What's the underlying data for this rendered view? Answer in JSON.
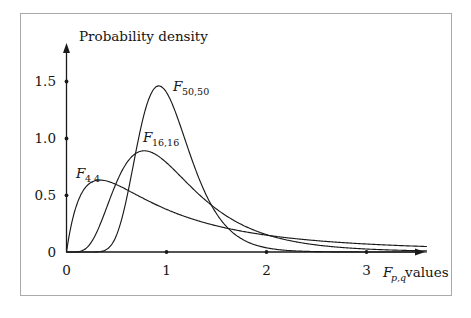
{
  "figure": {
    "background_color": "#ffffff",
    "frame_color": "#a9a9a9",
    "ink_color": "#1a1a1a"
  },
  "chart_data": {
    "type": "line",
    "title": "",
    "subtitle": "",
    "xlabel": "F_{p,q} values",
    "xlabel_base": "F",
    "xlabel_subscript": "p,q",
    "xlabel_suffix": "values",
    "ylabel": "Probability density",
    "xlim": [
      0,
      3.6
    ],
    "ylim": [
      0,
      1.62
    ],
    "grid": false,
    "legend_position": "inline-annotations",
    "xticks": [
      0,
      1,
      2,
      3
    ],
    "xtick_labels": [
      "0",
      "1",
      "2",
      "3"
    ],
    "yticks": [
      0,
      0.5,
      1.0,
      1.5
    ],
    "ytick_labels": [
      "0",
      "0.5",
      "1.0",
      "1.5"
    ],
    "tick_style": "dot",
    "axis_arrows": true,
    "series": [
      {
        "name": "F_{4,4}",
        "label_base": "F",
        "label_subscript": "4,4",
        "distribution": "F",
        "df1": 4,
        "df2": 4,
        "mode_x": 0.4,
        "peak_y": 0.62,
        "label_x": 0.13,
        "label_y": 0.79,
        "x": [
          0.0,
          0.05,
          0.1,
          0.15,
          0.2,
          0.25,
          0.3,
          0.35,
          0.4,
          0.45,
          0.5,
          0.6,
          0.7,
          0.8,
          0.9,
          1.0,
          1.2,
          1.4,
          1.6,
          1.8,
          2.0,
          2.2,
          2.4,
          2.6,
          2.8,
          3.0,
          3.2,
          3.4,
          3.6
        ],
        "y": [
          0.0,
          0.174,
          0.305,
          0.404,
          0.478,
          0.534,
          0.573,
          0.601,
          0.618,
          0.627,
          0.63,
          0.62,
          0.595,
          0.562,
          0.525,
          0.488,
          0.415,
          0.351,
          0.297,
          0.253,
          0.216,
          0.186,
          0.161,
          0.14,
          0.122,
          0.107,
          0.095,
          0.084,
          0.075
        ]
      },
      {
        "name": "F_{16,16}",
        "label_base": "F",
        "label_subscript": "16,16",
        "distribution": "F",
        "df1": 16,
        "df2": 16,
        "mode_x": 0.85,
        "peak_y": 0.88,
        "label_x": 0.78,
        "label_y": 1.04,
        "x": [
          0.0,
          0.1,
          0.2,
          0.3,
          0.4,
          0.5,
          0.6,
          0.7,
          0.8,
          0.9,
          1.0,
          1.1,
          1.2,
          1.4,
          1.6,
          1.8,
          2.0,
          2.2,
          2.4,
          2.6,
          2.8,
          3.0,
          3.2,
          3.4,
          3.6
        ],
        "y": [
          0.0,
          0.003,
          0.046,
          0.169,
          0.348,
          0.537,
          0.7,
          0.814,
          0.875,
          0.889,
          0.868,
          0.823,
          0.764,
          0.633,
          0.507,
          0.398,
          0.309,
          0.24,
          0.186,
          0.145,
          0.114,
          0.091,
          0.073,
          0.059,
          0.048
        ]
      },
      {
        "name": "F_{50,50}",
        "label_base": "F",
        "label_subscript": "50,50",
        "distribution": "F",
        "df1": 50,
        "df2": 50,
        "mode_x": 0.91,
        "peak_y": 1.46,
        "label_x": 1.01,
        "label_y": 1.33,
        "x": [
          0.0,
          0.2,
          0.3,
          0.4,
          0.5,
          0.6,
          0.7,
          0.8,
          0.9,
          1.0,
          1.1,
          1.2,
          1.3,
          1.4,
          1.6,
          1.8,
          2.0,
          2.2,
          2.4,
          2.6,
          2.8,
          3.0,
          3.2,
          3.4,
          3.6
        ],
        "y": [
          0.0,
          0.0,
          0.002,
          0.02,
          0.106,
          0.316,
          0.667,
          1.081,
          1.396,
          1.46,
          1.301,
          1.03,
          0.757,
          0.532,
          0.25,
          0.115,
          0.054,
          0.026,
          0.013,
          0.007,
          0.004,
          0.002,
          0.001,
          0.001,
          0.0
        ]
      }
    ]
  }
}
